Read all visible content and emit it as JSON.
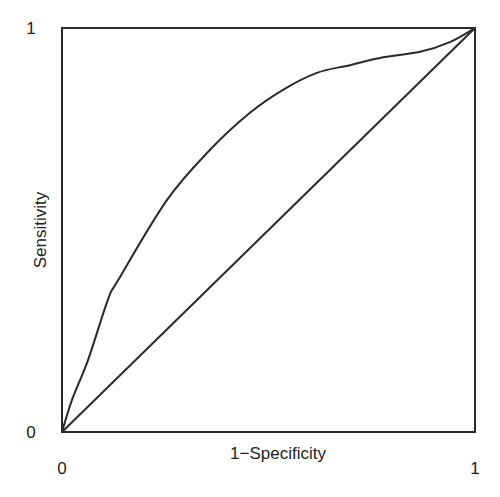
{
  "chart_data": {
    "type": "line",
    "title": "",
    "xlabel": "1−Specificity",
    "ylabel": "Sensitivity",
    "xlim": [
      0,
      1
    ],
    "ylim": [
      0,
      1
    ],
    "grid": false,
    "legend": "none",
    "x_ticks": [
      {
        "value": 0,
        "label": "0"
      },
      {
        "value": 1,
        "label": "1"
      }
    ],
    "y_ticks": [
      {
        "value": 0,
        "label": "0"
      },
      {
        "value": 1,
        "label": "1"
      }
    ],
    "series": [
      {
        "name": "ROC curve",
        "style": "smooth",
        "color": "#2a2a2a",
        "x": [
          0,
          0.024,
          0.063,
          0.111,
          0.136,
          0.254,
          0.358,
          0.455,
          0.535,
          0.617,
          0.697,
          0.77,
          0.867,
          0.939,
          1
        ],
        "y": [
          0,
          0.079,
          0.178,
          0.327,
          0.376,
          0.574,
          0.698,
          0.79,
          0.847,
          0.889,
          0.908,
          0.926,
          0.941,
          0.965,
          1
        ]
      },
      {
        "name": "Chance line",
        "style": "straight",
        "color": "#2a2a2a",
        "x": [
          0,
          1
        ],
        "y": [
          0,
          1
        ]
      }
    ]
  }
}
